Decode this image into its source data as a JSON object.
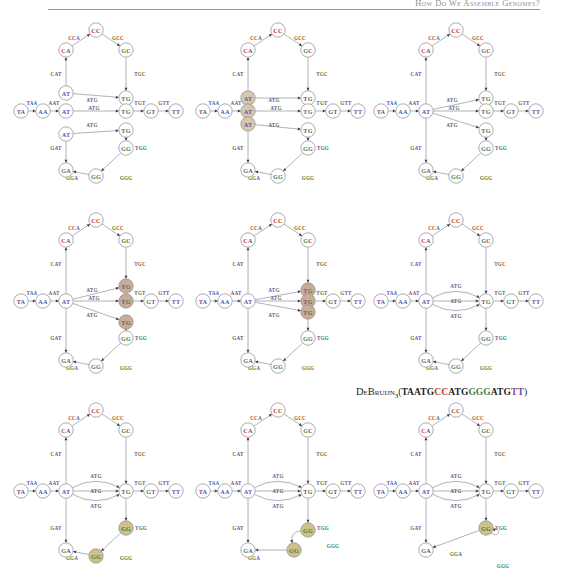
{
  "header": {
    "title": "How Do We Assemble Genomes?"
  },
  "caption": {
    "prefix": "D",
    "name_small": "eBruijn",
    "subscript": "3",
    "open_paren": "(",
    "close_paren": ")",
    "sequence": "TAATGCCATGGGATGTT",
    "sequence_colored": [
      {
        "t": "TAA",
        "color": "#1d1d1d"
      },
      {
        "t": "TG",
        "color": "#1d1d1d"
      },
      {
        "t": "CC",
        "color": "#c0392b"
      },
      {
        "t": "ATG",
        "color": "#1d1d1d"
      },
      {
        "t": "GGG",
        "color": "#3f7d3f"
      },
      {
        "t": "ATG",
        "color": "#1d1d1d"
      },
      {
        "t": "TT",
        "color": "#7a4b8f"
      }
    ]
  },
  "colors": {
    "A": "#3e5fa8",
    "C": "#c0392b",
    "G": "#3f7d3f",
    "T": "#7a4b8f",
    "neutral": "#44444c",
    "node_stroke": "#8a8a92",
    "edge": "#8a8a92",
    "highlight_at": "#d7c7ac",
    "highlight_tg": "#c9ac97",
    "highlight_gg": "#cfc289"
  },
  "figure": {
    "kind": "de-bruijn-graph-node-gluing-sequence",
    "panel_count": 9,
    "grid": {
      "rows": 3,
      "cols": 3
    },
    "nodes_base": [
      "TA",
      "AA",
      "AT",
      "CA",
      "CC",
      "GC",
      "TG",
      "GT",
      "TT",
      "GA",
      "GG",
      "AT",
      "TG",
      "AT",
      "TG",
      "GG"
    ],
    "edge_labels": [
      "TAA",
      "AAT",
      "CAT",
      "CCA",
      "GCC",
      "TGC",
      "ATG",
      "ATG",
      "ATG",
      "TGT",
      "GTT",
      "GAT",
      "GGA",
      "GGG",
      "TGG"
    ]
  },
  "panels": [
    {
      "index": 1,
      "name": "panel-1-unglued",
      "caption": "",
      "highlighted": [],
      "state": "all duplicate nodes separate"
    },
    {
      "index": 2,
      "name": "panel-2-at-selected",
      "caption": "",
      "highlighted": [
        "AT",
        "AT",
        "AT"
      ],
      "state": "three AT nodes selected for gluing"
    },
    {
      "index": 3,
      "name": "panel-3-at-glued",
      "caption": "",
      "highlighted": [
        "AT"
      ],
      "state": "AT nodes glued into one"
    },
    {
      "index": 4,
      "name": "panel-4-tg-selected",
      "caption": "",
      "highlighted": [
        "TG",
        "TG",
        "TG"
      ],
      "state": "three TG nodes selected for gluing"
    },
    {
      "index": 5,
      "name": "panel-5-tg-collapsing",
      "caption": "",
      "highlighted": [
        "TG",
        "TG",
        "TG"
      ],
      "state": "TG nodes pulled together"
    },
    {
      "index": 6,
      "name": "panel-6-tg-glued",
      "caption": "",
      "highlighted": [
        "TG"
      ],
      "state": "TG nodes glued into one, three parallel ATG edges"
    },
    {
      "index": 7,
      "name": "panel-7-gg-selected",
      "caption": "",
      "highlighted": [
        "GG",
        "GG"
      ],
      "state": "two GG nodes selected for gluing"
    },
    {
      "index": 8,
      "name": "panel-8-gg-collapsing",
      "caption": "",
      "highlighted": [
        "GG",
        "GG"
      ],
      "state": "GG nodes pulled together, GGG edge curving"
    },
    {
      "index": 9,
      "name": "panel-9-gg-glued",
      "caption": "",
      "highlighted": [
        "GG"
      ],
      "state": "GG nodes glued, GGG becomes a self-loop"
    }
  ]
}
